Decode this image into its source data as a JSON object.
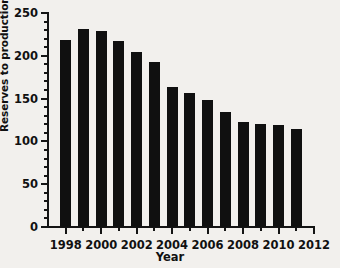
{
  "chart_data": {
    "type": "bar",
    "title": "",
    "xlabel": "Year",
    "ylabel": "Reserves to production ratio (years)",
    "categories": [
      1998,
      1999,
      2000,
      2001,
      2002,
      2003,
      2004,
      2005,
      2006,
      2007,
      2008,
      2009,
      2010,
      2011
    ],
    "values": [
      219,
      231,
      229,
      217,
      205,
      193,
      164,
      156,
      148,
      134,
      123,
      120,
      119,
      114
    ],
    "series": [
      {
        "name": "Reserves to production ratio",
        "values": [
          219,
          231,
          229,
          217,
          205,
          193,
          164,
          156,
          148,
          134,
          123,
          120,
          119,
          114
        ]
      }
    ],
    "ylim": [
      0,
      250
    ],
    "xlim": [
      1997,
      2012
    ],
    "y_major_ticks": [
      0,
      50,
      100,
      150,
      200,
      250
    ],
    "y_minor_tick_interval": 10,
    "y_tick_labels": [
      "0",
      "50",
      "100",
      "150",
      "200",
      "250"
    ],
    "x_major_ticks": [
      1998,
      2000,
      2002,
      2004,
      2006,
      2008,
      2010,
      2012
    ],
    "x_tick_labels": [
      "1998",
      "2000",
      "2002",
      "2004",
      "2006",
      "2008",
      "2010",
      "2012"
    ],
    "x_minor_ticks": [
      1999,
      2001,
      2003,
      2005,
      2007,
      2009,
      2011
    ],
    "grid": false,
    "legend": false,
    "legend_position": "none",
    "bar_color": "#101010",
    "axis_color": "#141414",
    "background_color": "#f2f0ed"
  }
}
